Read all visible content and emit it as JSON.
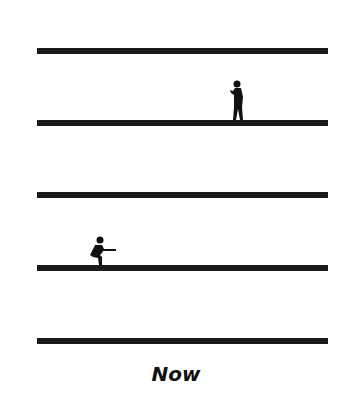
{
  "diagram": {
    "lines": [
      {
        "id": 1,
        "y": 48
      },
      {
        "id": 2,
        "y": 120
      },
      {
        "id": 3,
        "y": 192
      },
      {
        "id": 4,
        "y": 265
      },
      {
        "id": 5,
        "y": 338
      }
    ],
    "figures": [
      {
        "type": "standing-person",
        "line": 2
      },
      {
        "type": "crouching-person",
        "line": 4
      }
    ],
    "caption": "Now",
    "colors": {
      "line": "#1a1a1a",
      "background": "#ffffff"
    }
  }
}
